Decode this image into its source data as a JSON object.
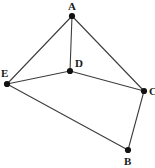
{
  "figure": {
    "type": "undirected-graph-diagram",
    "background_color": "#ffffff",
    "edge_color": "#3d3d3d",
    "vertex_color": "#111111",
    "label_color": "#1a1a1a",
    "width": 155,
    "height": 168
  },
  "chart_data": {
    "type": "diagram",
    "title": "",
    "nodes": [
      {
        "id": "A",
        "label": "A",
        "x": 72,
        "y": 16,
        "label_x": 68,
        "label_y": 1
      },
      {
        "id": "B",
        "label": "B",
        "x": 128,
        "y": 150,
        "label_x": 124,
        "label_y": 156
      },
      {
        "id": "C",
        "label": "C",
        "x": 144,
        "y": 91,
        "label_x": 149,
        "label_y": 86
      },
      {
        "id": "D",
        "label": "D",
        "x": 70,
        "y": 71,
        "label_x": 75,
        "label_y": 58
      },
      {
        "id": "E",
        "label": "E",
        "x": 7,
        "y": 84,
        "label_x": 1,
        "label_y": 68
      }
    ],
    "edges": [
      {
        "from": "A",
        "to": "E"
      },
      {
        "from": "A",
        "to": "D"
      },
      {
        "from": "A",
        "to": "C"
      },
      {
        "from": "E",
        "to": "D"
      },
      {
        "from": "D",
        "to": "C"
      },
      {
        "from": "E",
        "to": "B"
      },
      {
        "from": "B",
        "to": "C"
      }
    ],
    "node_count": 5,
    "edge_count": 7
  }
}
